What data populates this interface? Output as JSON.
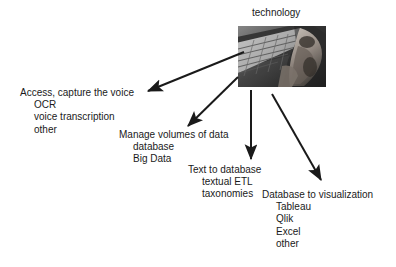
{
  "diagram": {
    "type": "node-arrow-diagram",
    "background_color": "#ffffff",
    "text_color": "#1a1a1a",
    "root": {
      "label": "technology",
      "image": {
        "name": "keyboard-photo",
        "description": "grayscale photo of hands typing on a computer keyboard",
        "grayscale": true
      }
    },
    "branches": [
      {
        "id": "branch-access",
        "heading": "Access, capture the voice",
        "items": [
          "OCR",
          "voice transcription",
          "other"
        ]
      },
      {
        "id": "branch-manage",
        "heading": "Manage volumes of data",
        "items": [
          "database",
          "Big Data"
        ]
      },
      {
        "id": "branch-text",
        "heading": "Text to database",
        "items": [
          "textual ETL",
          "taxonomies"
        ]
      },
      {
        "id": "branch-visualization",
        "heading": "Database to visualization",
        "items": [
          "Tableau",
          "Qlik",
          "Excel",
          "other"
        ]
      }
    ],
    "arrows": [
      {
        "id": "arrow-to-access",
        "from": [
          244,
          52
        ],
        "to": [
          146,
          92
        ],
        "color": "#1a1a1a"
      },
      {
        "id": "arrow-to-manage",
        "from": [
          238,
          77
        ],
        "to": [
          187,
          127
        ],
        "color": "#1a1a1a"
      },
      {
        "id": "arrow-to-text",
        "from": [
          251,
          90
        ],
        "to": [
          251,
          161
        ],
        "color": "#1a1a1a"
      },
      {
        "id": "arrow-to-visualization",
        "from": [
          272,
          94
        ],
        "to": [
          323,
          182
        ],
        "color": "#1a1a1a"
      }
    ]
  }
}
